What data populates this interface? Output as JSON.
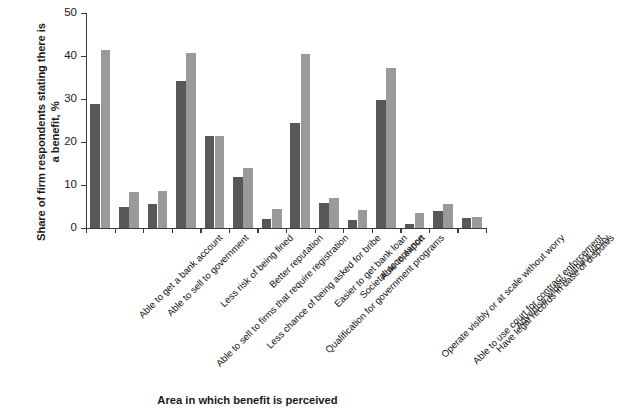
{
  "chart_data": {
    "type": "bar",
    "title": "",
    "xlabel": "Area in which benefit is perceived",
    "ylabel": "Share of firm respondents stating there is a benefit, %",
    "ylim": [
      0,
      50
    ],
    "yticks": [
      0,
      10,
      20,
      30,
      40,
      50
    ],
    "grid": false,
    "legend": "none",
    "categories": [
      "Able to get a bank account",
      "Able to sell to government",
      "Able to sell to firms that require registration",
      "Less risk of being fined",
      "Less chance of being asked for bribe",
      "Better reputation",
      "Qualification for government programs",
      "Easier to get bank loan",
      "Societal acceptance",
      "Able to export",
      "Operate visibly or at scale without worry",
      "Able to use court for contract enforcement",
      "Have legal records in case of disputes",
      "Advertise widely without worry"
    ],
    "series": [
      {
        "name": "series-dark",
        "color": "#585858",
        "values": [
          28.8,
          4.9,
          5.6,
          34.3,
          21.3,
          11.8,
          2.1,
          24.5,
          5.8,
          1.9,
          29.7,
          0.9,
          3.9,
          2.4
        ]
      },
      {
        "name": "series-light",
        "color": "#9a9a9a",
        "values": [
          41.5,
          8.4,
          8.6,
          40.6,
          21.5,
          13.9,
          4.5,
          40.4,
          6.9,
          4.2,
          37.1,
          3.4,
          5.5,
          2.5
        ]
      }
    ]
  },
  "axis": {
    "y_tick_labels": [
      "0",
      "10",
      "20",
      "30",
      "40",
      "50"
    ]
  }
}
